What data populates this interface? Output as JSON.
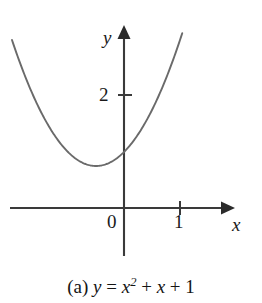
{
  "figure": {
    "caption_prefix": "(a)",
    "caption_dependent_var": "y",
    "caption_equals": "=",
    "caption_var_x": "x",
    "caption_exponent": "2",
    "caption_plus_1": "+",
    "caption_var_x2": "x",
    "caption_plus_2": "+",
    "caption_constant": "1",
    "caption_full": "(a) y = x2 + x + 1"
  },
  "axes": {
    "y_axis_label": "y",
    "x_axis_label": "x",
    "origin_label": "0",
    "y_tick_label": "2",
    "x_tick_label": "1",
    "y_arrow_icon": "arrow-up-icon",
    "x_arrow_icon": "arrow-right-icon"
  },
  "colors": {
    "curve": "#6a6a6a",
    "axis": "#3a3a3a",
    "text": "#1a1a1a",
    "background": "#ffffff"
  },
  "chart_data": {
    "type": "line",
    "xlabel": "x",
    "ylabel": "y",
    "equation": "y = x^2 + x + 1",
    "coefficients": {
      "a": 1,
      "b": 1,
      "c": 1
    },
    "vertex": [
      -0.5,
      0.75
    ],
    "y_intercept": 1,
    "xlim": [
      -2.0,
      1.1
    ],
    "ylim": [
      -0.1,
      3.2
    ],
    "xticks": [
      0,
      1
    ],
    "xtick_labels": [
      "0",
      "1"
    ],
    "yticks": [
      2
    ],
    "ytick_labels": [
      "2"
    ],
    "grid": false,
    "legend": "none",
    "x": [
      -2.0,
      -1.8,
      -1.6,
      -1.4,
      -1.2,
      -1.0,
      -0.8,
      -0.6,
      -0.5,
      -0.4,
      -0.2,
      0.0,
      0.2,
      0.4,
      0.6,
      0.8,
      1.0,
      1.1
    ],
    "y": [
      3.0,
      2.44,
      1.96,
      1.56,
      1.24,
      1.0,
      0.84,
      0.76,
      0.75,
      0.76,
      0.84,
      1.0,
      1.24,
      1.56,
      1.96,
      2.44,
      3.0,
      3.31
    ]
  }
}
